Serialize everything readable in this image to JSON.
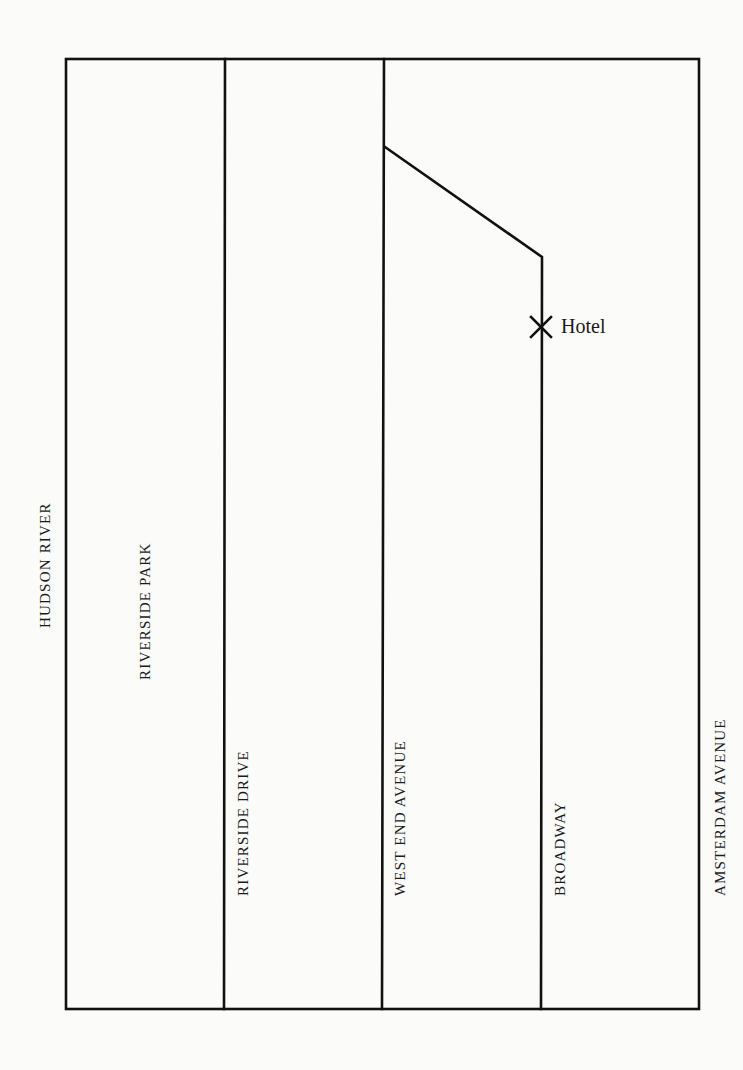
{
  "map": {
    "title": "",
    "streets": [
      {
        "id": "hudson-river",
        "label": "HUDSON RIVER"
      },
      {
        "id": "riverside-park",
        "label": "RIVERSIDE PARK"
      },
      {
        "id": "riverside-drive",
        "label": "RIVERSIDE DRIVE"
      },
      {
        "id": "west-end-avenue",
        "label": "WEST END AVENUE"
      },
      {
        "id": "broadway",
        "label": "BROADWAY"
      },
      {
        "id": "amsterdam-avenue",
        "label": "AMSTERDAM AVENUE"
      }
    ],
    "marker": {
      "symbol": "X",
      "label": "Hotel"
    },
    "colors": {
      "line": "#111111",
      "background": "#fbfbfa",
      "text": "#1a1a1a"
    }
  }
}
